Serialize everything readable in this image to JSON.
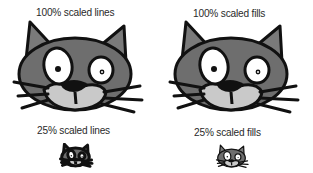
{
  "panels": [
    {
      "id": "lines-100",
      "label": "100% scaled lines",
      "scale": 1.0,
      "stroke_scaled": true
    },
    {
      "id": "fills-100",
      "label": "100% scaled fills",
      "scale": 1.0,
      "stroke_scaled": false
    },
    {
      "id": "lines-25",
      "label": "25% scaled lines",
      "scale": 0.25,
      "stroke_scaled": true
    },
    {
      "id": "fills-25",
      "label": "25% scaled fills",
      "scale": 0.25,
      "stroke_scaled": false
    }
  ],
  "colors": {
    "background": "#ffffff",
    "outline": "#111111",
    "head_fill": "#6e6e6e",
    "ear_fill": "#7a7a7a",
    "muzzle_fill": "#c9c9c9",
    "eye_fill": "#ffffff",
    "text": "#2a2a2a"
  }
}
